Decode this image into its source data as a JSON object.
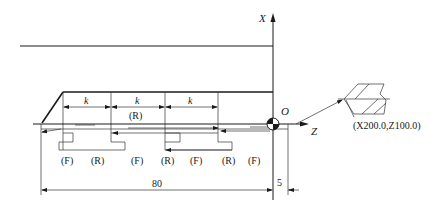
{
  "diagram": {
    "type": "thread-turning-tool-path",
    "axes": {
      "x_label": "X",
      "z_label": "Z",
      "origin_label": "O"
    },
    "pitch_labels": [
      "k",
      "k",
      "k"
    ],
    "center_label": "(R)",
    "motion_labels": [
      "(F)",
      "(R)",
      "(F)",
      "(R)",
      "(F)",
      "(R)",
      "(F)"
    ],
    "dimensions": {
      "length": "80",
      "offset": "5"
    },
    "start_point_label": "(X200.0,Z100.0)",
    "colors": {
      "line": "#1a1a1a",
      "background": "#ffffff"
    }
  }
}
